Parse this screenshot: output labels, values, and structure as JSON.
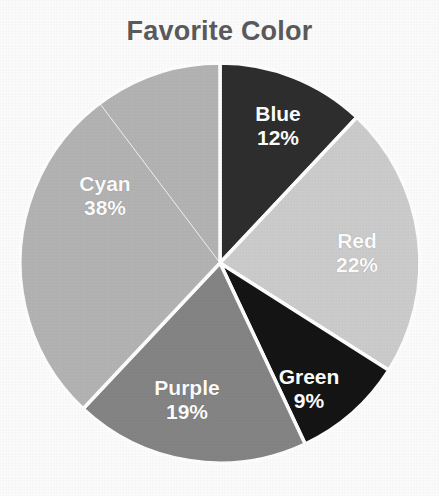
{
  "chart_data": {
    "type": "pie",
    "title": "Favorite Color",
    "xlabel": "",
    "ylabel": "",
    "legend": "none",
    "grid": false,
    "start_angle_deg": 0,
    "direction": "clockwise",
    "categories": [
      "Blue",
      "Red",
      "Green",
      "Purple",
      "Cyan"
    ],
    "values": [
      12,
      22,
      9,
      19,
      38
    ],
    "value_unit": "percent",
    "slices": [
      {
        "label": "Blue",
        "percent": 12,
        "percent_text": "12%",
        "color": "#2e2e2e",
        "label_x": 278,
        "label_y": 126
      },
      {
        "label": "Red",
        "percent": 22,
        "percent_text": "22%",
        "color": "#cdcdcd",
        "label_x": 357,
        "label_y": 253
      },
      {
        "label": "Green",
        "percent": 9,
        "percent_text": "9%",
        "color": "#151515",
        "label_x": 309,
        "label_y": 389
      },
      {
        "label": "Purple",
        "percent": 19,
        "percent_text": "19%",
        "color": "#858585",
        "label_x": 187,
        "label_y": 400
      },
      {
        "label": "Cyan",
        "percent": 38,
        "percent_text": "38%",
        "color": "#b4b4b4",
        "label_x": 105,
        "label_y": 196
      }
    ],
    "geometry": {
      "center_x": 220,
      "center_y": 263,
      "radius": 200,
      "separator_color": "#ffffff",
      "separator_width": 3.5
    },
    "colors": {
      "background": "#fdfdfd",
      "title_color": "#5b5b5b",
      "label_color": "#ffffff"
    }
  }
}
